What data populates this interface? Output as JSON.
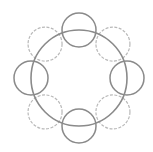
{
  "diagram": {
    "width": 153,
    "height": 152,
    "background": "#ffffff",
    "center": {
      "x": 79,
      "y": 78
    },
    "main_circle": {
      "r": 48,
      "stroke": "#8a8a8a",
      "stroke_width": 1.6,
      "style": "solid"
    },
    "orbit_radius": 48,
    "satellites": [
      {
        "name": "top",
        "angle": -90,
        "r": 17,
        "style": "solid",
        "stroke": "#8a8a8a"
      },
      {
        "name": "upper-right",
        "angle": -45,
        "r": 17,
        "style": "dashed",
        "stroke": "#b8b8b8"
      },
      {
        "name": "right",
        "angle": 0,
        "r": 17,
        "style": "solid",
        "stroke": "#8a8a8a"
      },
      {
        "name": "lower-right",
        "angle": 45,
        "r": 17,
        "style": "dashed",
        "stroke": "#b8b8b8"
      },
      {
        "name": "bottom",
        "angle": 90,
        "r": 17,
        "style": "solid",
        "stroke": "#8a8a8a"
      },
      {
        "name": "lower-left",
        "angle": 135,
        "r": 17,
        "style": "dashed",
        "stroke": "#b8b8b8"
      },
      {
        "name": "left",
        "angle": 180,
        "r": 17,
        "style": "solid",
        "stroke": "#8a8a8a"
      },
      {
        "name": "upper-left",
        "angle": -135,
        "r": 17,
        "style": "dashed",
        "stroke": "#b8b8b8"
      }
    ]
  }
}
